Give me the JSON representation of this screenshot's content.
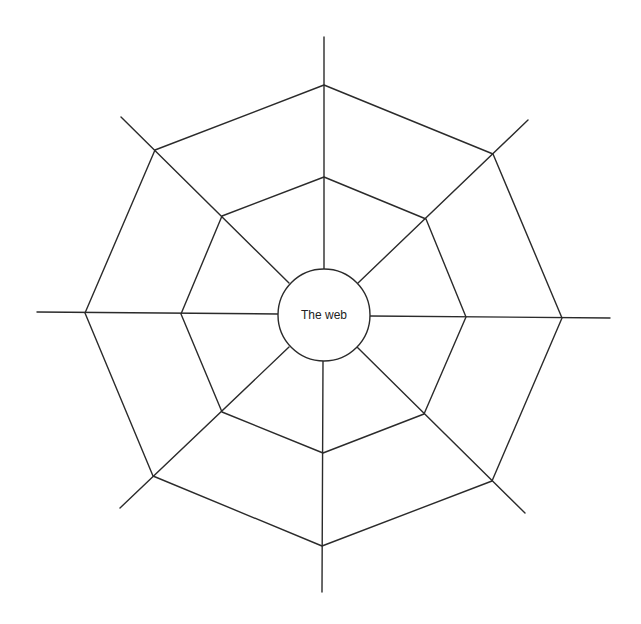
{
  "diagram": {
    "type": "spider-web",
    "center_label": "The web",
    "stroke_color": "#2b2b2b",
    "background": "#ffffff",
    "hub": {
      "cx": 324,
      "cy": 315,
      "r": 46
    },
    "outer_ring": [
      [
        324,
        85
      ],
      [
        493,
        154
      ],
      [
        562,
        318
      ],
      [
        492,
        481
      ],
      [
        322,
        546
      ],
      [
        153,
        476
      ],
      [
        85,
        313
      ],
      [
        155,
        150
      ]
    ],
    "inner_ring": [
      [
        324,
        177
      ],
      [
        426,
        219
      ],
      [
        466,
        317
      ],
      [
        424,
        414
      ],
      [
        323,
        453
      ],
      [
        222,
        412
      ],
      [
        181,
        314
      ],
      [
        222,
        216
      ]
    ],
    "spokes": [
      {
        "from": [
          324,
          269
        ],
        "to": [
          324,
          37
        ]
      },
      {
        "from": [
          358,
          283
        ],
        "to": [
          528,
          120
        ]
      },
      {
        "from": [
          370,
          316
        ],
        "to": [
          610,
          318
        ]
      },
      {
        "from": [
          357,
          347
        ],
        "to": [
          525,
          513
        ]
      },
      {
        "from": [
          323,
          361
        ],
        "to": [
          322,
          592
        ]
      },
      {
        "from": [
          289,
          347
        ],
        "to": [
          120,
          508
        ]
      },
      {
        "from": [
          278,
          314
        ],
        "to": [
          37,
          312
        ]
      },
      {
        "from": [
          289,
          283
        ],
        "to": [
          121,
          117
        ]
      }
    ]
  }
}
